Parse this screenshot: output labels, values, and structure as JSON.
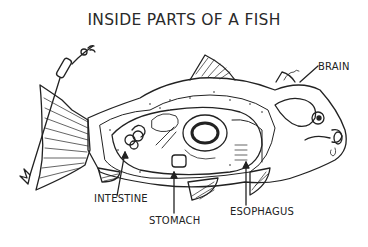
{
  "diagram": {
    "title": "INSIDE PARTS OF A FISH",
    "labels": {
      "brain": "BRAIN",
      "intestine": "INTESTINE",
      "stomach": "STOMACH",
      "esophagus": "ESOPHAGUS"
    },
    "colors": {
      "ink": "#222222",
      "background": "#ffffff"
    }
  }
}
